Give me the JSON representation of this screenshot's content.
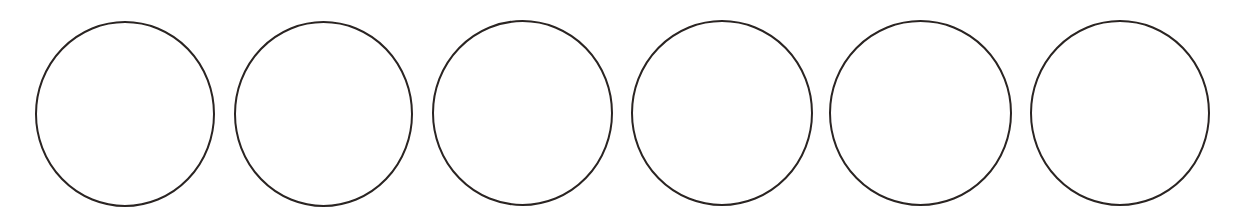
{
  "diagram": {
    "background": "#ffffff",
    "stroke_color": "#2a2422",
    "stroke_width": 2,
    "fill": "none",
    "circles": [
      {
        "id": 1,
        "cx": 125,
        "cy": 114,
        "rx": 89,
        "ry": 92
      },
      {
        "id": 2,
        "cx": 323.5,
        "cy": 114,
        "rx": 88.5,
        "ry": 92
      },
      {
        "id": 3,
        "cx": 522.5,
        "cy": 113,
        "rx": 89.5,
        "ry": 92
      },
      {
        "id": 4,
        "cx": 722,
        "cy": 113,
        "rx": 90,
        "ry": 92
      },
      {
        "id": 5,
        "cx": 920.5,
        "cy": 113,
        "rx": 90.5,
        "ry": 92
      },
      {
        "id": 6,
        "cx": 1120,
        "cy": 113,
        "rx": 89,
        "ry": 92
      }
    ]
  }
}
